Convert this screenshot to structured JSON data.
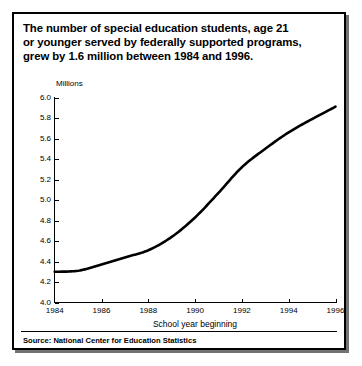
{
  "headline": {
    "line1": "The number of special education students, age 21",
    "line2": "or younger served by federally supported programs,",
    "line3": "grew by 1.6 million between 1984 and 1996."
  },
  "source": {
    "text": "Source: National Center for Education Statistics"
  },
  "chart_data": {
    "type": "line",
    "title": "The number of special education students, age 21 or younger served by federally supported programs, grew by 1.6 million between 1984 and 1996.",
    "xlabel": "School year beginning",
    "ylabel": "Millions",
    "unit_label": "Millions",
    "xlim": [
      1984,
      1996
    ],
    "ylim": [
      4.0,
      6.0
    ],
    "grid": false,
    "legend": false,
    "yticks": [
      "4.0",
      "4.2",
      "4.4",
      "4.6",
      "4.8",
      "5.0",
      "5.2",
      "5.4",
      "5.6",
      "5.8",
      "6.0"
    ],
    "ytick_values": [
      4.0,
      4.2,
      4.4,
      4.6,
      4.8,
      5.0,
      5.2,
      5.4,
      5.6,
      5.8,
      6.0
    ],
    "xticks": [
      "1984",
      "1986",
      "1988",
      "1990",
      "1992",
      "1994",
      "1996"
    ],
    "xtick_values": [
      1984,
      1986,
      1988,
      1990,
      1992,
      1994,
      1996
    ],
    "x": [
      1984,
      1985,
      1986,
      1987,
      1988,
      1989,
      1990,
      1991,
      1992,
      1993,
      1994,
      1995,
      1996
    ],
    "values": [
      4.3,
      4.31,
      4.37,
      4.44,
      4.51,
      4.64,
      4.83,
      5.07,
      5.32,
      5.5,
      5.66,
      5.79,
      5.91
    ],
    "series_name": "Special education students (millions)",
    "line_color": "#000000",
    "background_color": "#ffffff"
  }
}
